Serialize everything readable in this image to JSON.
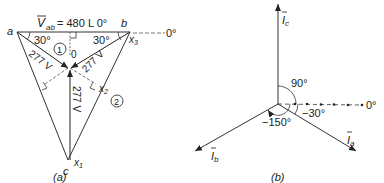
{
  "diagram_a": {
    "caption": "(a)",
    "vertices": {
      "a": "a",
      "b": "b",
      "c": "c"
    },
    "voltage_label_prefix": "V",
    "voltage_label_sub": "ab",
    "voltage_label_value": "= 480  L 0°",
    "angle_left": "30°",
    "angle_right": "30°",
    "zero_ref": "0°",
    "center_label": "0",
    "phase_voltages": [
      "277 V",
      "277 V",
      "277 V"
    ],
    "points": {
      "x1": "x",
      "x1_sub": "1",
      "x2": "x",
      "x2_sub": "2",
      "x3": "x",
      "x3_sub": "3"
    },
    "circled": [
      "1",
      "2"
    ]
  },
  "diagram_b": {
    "caption": "(b)",
    "phasors": [
      {
        "name": "I",
        "sub": "c",
        "angle": "90°"
      },
      {
        "name": "I",
        "sub": "a",
        "angle": "-30°"
      },
      {
        "name": "I",
        "sub": "b",
        "angle": "-150°"
      }
    ],
    "angle_90": "90°",
    "angle_neg30": "−30°",
    "angle_neg150": "−150°",
    "zero_ref": "0°"
  }
}
